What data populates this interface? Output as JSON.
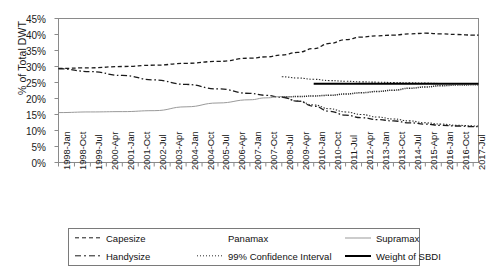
{
  "chart_data": {
    "type": "line",
    "title": "",
    "xlabel": "",
    "ylabel": "% of Total DWT",
    "ylim": [
      0,
      45
    ],
    "ytick_labels": [
      "45%",
      "40%",
      "35%",
      "30%",
      "25%",
      "20%",
      "15%",
      "10%",
      "5%",
      "0%"
    ],
    "ytick_values": [
      45,
      40,
      35,
      30,
      25,
      20,
      15,
      10,
      5,
      0
    ],
    "grid": false,
    "legend_position": "bottom",
    "x_tick_labels": [
      "1998-Jan",
      "1998-Oct",
      "1999-Jul",
      "2000-Apr",
      "2001-Jan",
      "2001-Oct",
      "2002-Jul",
      "2003-Apr",
      "2004-Jan",
      "2004-Oct",
      "2005-Jul",
      "2006-Apr",
      "2007-Jan",
      "2007-Oct",
      "2008-Jul",
      "2009-Apr",
      "2010-Jan",
      "2010-Oct",
      "2011-Jul",
      "2012-Apr",
      "2013-Jan",
      "2013-Oct",
      "2014-Jul",
      "2015-Apr",
      "2016-Jan",
      "2016-Oct",
      "2017-Jul"
    ],
    "x_range_start": "1998-Jan",
    "x_range_end": "2017-Oct",
    "series": [
      {
        "name": "Capesize",
        "style": "dashed",
        "color": "#1a1a1a",
        "x": [
          "1998-Jan",
          "1999-Jul",
          "2001-Jan",
          "2002-Jul",
          "2004-Jan",
          "2005-Jul",
          "2007-Jan",
          "2007-Oct",
          "2008-Jul",
          "2009-Apr",
          "2010-Jan",
          "2010-Oct",
          "2011-Jul",
          "2012-Apr",
          "2013-Jan",
          "2013-Oct",
          "2014-Jul",
          "2015-Apr",
          "2016-Jan",
          "2016-Oct",
          "2017-Jul",
          "2017-Oct"
        ],
        "values": [
          29.4,
          29.6,
          30.0,
          30.4,
          31.0,
          31.6,
          32.6,
          33.0,
          33.6,
          34.4,
          35.6,
          37.2,
          38.4,
          39.2,
          39.6,
          39.8,
          40.2,
          40.4,
          40.2,
          40.0,
          39.8,
          39.8
        ]
      },
      {
        "name": "Handysize",
        "style": "dash-dot",
        "color": "#1a1a1a",
        "x": [
          "1998-Jan",
          "1999-Jul",
          "2001-Jan",
          "2002-Jul",
          "2004-Jan",
          "2005-Jul",
          "2007-Jan",
          "2007-Oct",
          "2008-Jul",
          "2009-Apr",
          "2010-Jan",
          "2010-Oct",
          "2011-Jul",
          "2012-Apr",
          "2013-Jan",
          "2013-Oct",
          "2014-Jul",
          "2015-Apr",
          "2016-Jan",
          "2016-Oct",
          "2017-Jul",
          "2017-Oct"
        ],
        "values": [
          29.3,
          28.4,
          27.2,
          25.8,
          24.4,
          23.0,
          21.6,
          21.0,
          20.4,
          19.2,
          17.6,
          16.0,
          14.8,
          14.0,
          13.4,
          13.0,
          12.4,
          12.0,
          11.6,
          11.4,
          11.2,
          11.2
        ]
      },
      {
        "name": "Supramax",
        "style": "solid-light",
        "color": "#9a9a9a",
        "x": [
          "1998-Jan",
          "1999-Jul",
          "2001-Jan",
          "2002-Jul",
          "2004-Jan",
          "2005-Jul",
          "2007-Jan",
          "2007-Oct",
          "2008-Jul"
        ],
        "values": [
          15.6,
          15.8,
          15.9,
          16.2,
          17.4,
          18.6,
          19.6,
          20.2,
          20.6
        ]
      },
      {
        "name": "Panamax",
        "style": "invisible",
        "color": "#ffffff",
        "x": [],
        "values": []
      },
      {
        "name": "99% Confidence Interval",
        "style": "dotted",
        "color": "#2b2b2b",
        "bounds": "upper",
        "x": [
          "2008-Jul",
          "2009-Apr",
          "2010-Jan",
          "2010-Oct",
          "2011-Jul",
          "2012-Apr",
          "2013-Jan",
          "2013-Oct",
          "2014-Jul",
          "2015-Apr",
          "2016-Jan",
          "2016-Oct",
          "2017-Oct"
        ],
        "values": [
          26.8,
          26.4,
          26.0,
          25.6,
          25.4,
          25.2,
          25.1,
          25.0,
          24.9,
          24.8,
          24.7,
          24.6,
          24.6
        ]
      },
      {
        "name": "99% Confidence Interval Lower",
        "style": "dotted",
        "color": "#2b2b2b",
        "bounds": "lower",
        "x": [
          "2008-Jul",
          "2009-Apr",
          "2010-Jan",
          "2010-Oct",
          "2011-Jul",
          "2012-Apr",
          "2013-Jan",
          "2013-Oct",
          "2014-Jul",
          "2015-Apr",
          "2016-Jan",
          "2016-Oct",
          "2017-Oct"
        ],
        "values": [
          20.4,
          19.2,
          18.0,
          16.8,
          15.8,
          15.0,
          14.2,
          13.6,
          13.0,
          12.4,
          12.0,
          11.6,
          11.4
        ]
      },
      {
        "name": "Weight of SBDI",
        "style": "solid-bold",
        "color": "#000000",
        "x": [
          "2010-Jan",
          "2011-Jul",
          "2013-Jan",
          "2014-Jul",
          "2016-Jan",
          "2017-Oct"
        ],
        "values": [
          24.6,
          24.6,
          24.6,
          24.6,
          24.6,
          24.6
        ]
      },
      {
        "name": "Forecast Mean",
        "style": "fine-dotted",
        "color": "#2b2b2b",
        "x": [
          "2008-Jul",
          "2009-Apr",
          "2010-Jan",
          "2010-Oct",
          "2011-Jul",
          "2012-Apr",
          "2013-Jan",
          "2013-Oct",
          "2014-Jul",
          "2015-Apr",
          "2016-Jan",
          "2016-Oct",
          "2017-Oct"
        ],
        "values": [
          20.5,
          20.6,
          20.8,
          21.0,
          21.4,
          21.8,
          22.2,
          22.6,
          23.2,
          23.6,
          24.0,
          24.2,
          24.3
        ]
      }
    ]
  },
  "axis": {
    "y_title": "% of Total DWT"
  },
  "legend": {
    "entries": [
      {
        "label": "Capesize",
        "icon": "dashed-line-icon"
      },
      {
        "label": "Panamax",
        "icon": "blank-line-icon"
      },
      {
        "label": "Supramax",
        "icon": "light-solid-line-icon"
      },
      {
        "label": "Handysize",
        "icon": "dash-dot-line-icon"
      },
      {
        "label": "99% Confidence Interval",
        "icon": "dotted-line-icon"
      },
      {
        "label": "Weight of SBDI",
        "icon": "bold-solid-line-icon"
      }
    ]
  }
}
